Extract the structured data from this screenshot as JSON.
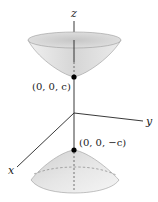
{
  "diagram": {
    "axes": {
      "x": "x",
      "y": "y",
      "z": "z"
    },
    "points": {
      "upper_vertex": "(0, 0, c)",
      "lower_vertex": "(0, 0, −c)"
    },
    "colors": {
      "surface": "#d9d9d9",
      "surface_light": "#f2f2f2",
      "axis": "#222222",
      "point": "#000000"
    }
  }
}
